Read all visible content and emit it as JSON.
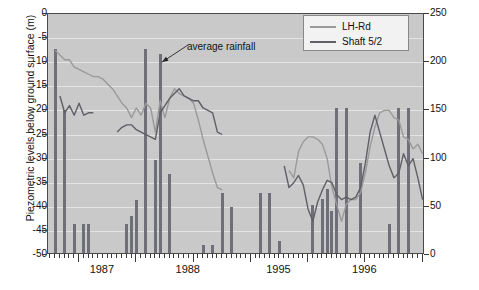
{
  "chart_data": {
    "type": "bar",
    "title": "",
    "xlabel": "",
    "ylabel": "Piezometric levels below ground surface (m)",
    "y2label": "Monthly rainfall (mm)",
    "ylim": [
      -50,
      0
    ],
    "y2lim": [
      0,
      250
    ],
    "yticks": [
      0,
      -5,
      -10,
      -15,
      -20,
      -25,
      -30,
      -35,
      -40,
      -45,
      -50
    ],
    "y2ticks": [
      0,
      50,
      100,
      150,
      200,
      250
    ],
    "x_year_labels": [
      "1987",
      "1988",
      "1995",
      "1996"
    ],
    "grid": true,
    "legend_position": "top-right",
    "annotations": [
      {
        "text": "average rainfall",
        "points_to_bar_index": 23
      }
    ],
    "bars": {
      "name": "Monthly rainfall",
      "color": "#6f6f79",
      "unit": "mm",
      "values": [
        {
          "i": 0,
          "mm": 0
        },
        {
          "i": 1,
          "mm": 212
        },
        {
          "i": 2,
          "mm": 0
        },
        {
          "i": 3,
          "mm": 148
        },
        {
          "i": 4,
          "mm": 0
        },
        {
          "i": 5,
          "mm": 30
        },
        {
          "i": 6,
          "mm": 0
        },
        {
          "i": 7,
          "mm": 30
        },
        {
          "i": 8,
          "mm": 30
        },
        {
          "i": 9,
          "mm": 0
        },
        {
          "i": 10,
          "mm": 0
        },
        {
          "i": 11,
          "mm": 0
        },
        {
          "i": 12,
          "mm": 0
        },
        {
          "i": 13,
          "mm": 0
        },
        {
          "i": 14,
          "mm": 0
        },
        {
          "i": 15,
          "mm": 0
        },
        {
          "i": 16,
          "mm": 30
        },
        {
          "i": 17,
          "mm": 38
        },
        {
          "i": 18,
          "mm": 55
        },
        {
          "i": 19,
          "mm": 0
        },
        {
          "i": 20,
          "mm": 212
        },
        {
          "i": 21,
          "mm": 0
        },
        {
          "i": 22,
          "mm": 97
        },
        {
          "i": 23,
          "mm": 206
        },
        {
          "i": 24,
          "mm": 0
        },
        {
          "i": 25,
          "mm": 82
        },
        {
          "i": 26,
          "mm": 0
        },
        {
          "i": 27,
          "mm": 0
        },
        {
          "i": 28,
          "mm": 0
        },
        {
          "i": 29,
          "mm": 0
        },
        {
          "i": 30,
          "mm": 0
        },
        {
          "i": 31,
          "mm": 0
        },
        {
          "i": 32,
          "mm": 8
        },
        {
          "i": 33,
          "mm": 0
        },
        {
          "i": 34,
          "mm": 8
        },
        {
          "i": 35,
          "mm": 0
        },
        {
          "i": 36,
          "mm": 62
        },
        {
          "i": 37,
          "mm": 0
        },
        {
          "i": 38,
          "mm": 48
        },
        {
          "i": 39,
          "mm": 0
        },
        {
          "i": 40,
          "mm": 0
        },
        {
          "i": 41,
          "mm": 0
        },
        {
          "i": 42,
          "mm": 0
        },
        {
          "i": 43,
          "mm": 0
        },
        {
          "i": 44,
          "mm": 62
        },
        {
          "i": 45,
          "mm": 0
        },
        {
          "i": 46,
          "mm": 62
        },
        {
          "i": 47,
          "mm": 0
        },
        {
          "i": 48,
          "mm": 12
        },
        {
          "i": 49,
          "mm": 0
        },
        {
          "i": 50,
          "mm": 0
        },
        {
          "i": 51,
          "mm": 0
        },
        {
          "i": 52,
          "mm": 0
        },
        {
          "i": 53,
          "mm": 0
        },
        {
          "i": 54,
          "mm": 0
        },
        {
          "i": 55,
          "mm": 50
        },
        {
          "i": 56,
          "mm": 0
        },
        {
          "i": 57,
          "mm": 56
        },
        {
          "i": 58,
          "mm": 66
        },
        {
          "i": 59,
          "mm": 44
        },
        {
          "i": 60,
          "mm": 150
        },
        {
          "i": 61,
          "mm": 0
        },
        {
          "i": 62,
          "mm": 150
        },
        {
          "i": 63,
          "mm": 0
        },
        {
          "i": 64,
          "mm": 0
        },
        {
          "i": 65,
          "mm": 93
        },
        {
          "i": 66,
          "mm": 0
        },
        {
          "i": 67,
          "mm": 0
        },
        {
          "i": 68,
          "mm": 0
        },
        {
          "i": 69,
          "mm": 0
        },
        {
          "i": 70,
          "mm": 0
        },
        {
          "i": 71,
          "mm": 30
        },
        {
          "i": 72,
          "mm": 0
        },
        {
          "i": 73,
          "mm": 150
        },
        {
          "i": 74,
          "mm": 0
        },
        {
          "i": 75,
          "mm": 150
        }
      ]
    },
    "series": [
      {
        "name": "LH-Rd",
        "color": "#9a9a9a",
        "unit": "m",
        "points": [
          {
            "i": 1,
            "m": -7.5
          },
          {
            "i": 2,
            "m": -8.5
          },
          {
            "i": 3,
            "m": -9.5
          },
          {
            "i": 4,
            "m": -9.5
          },
          {
            "i": 5,
            "m": -11.0
          },
          {
            "i": 6,
            "m": -11.5
          },
          {
            "i": 7,
            "m": -12.0
          },
          {
            "i": 8,
            "m": -12.5
          },
          {
            "i": 9,
            "m": -13.0
          },
          {
            "i": 10,
            "m": -13.0
          },
          {
            "i": 11,
            "m": -13.5
          },
          {
            "i": 12,
            "m": -14.5
          },
          {
            "i": 13,
            "m": -15.5
          },
          {
            "i": 14,
            "m": -17.0
          },
          {
            "i": 15,
            "m": -18.5
          },
          {
            "i": 16,
            "m": -19.5
          },
          {
            "i": 17,
            "m": -21.5
          },
          {
            "i": 18,
            "m": -19.5
          },
          {
            "i": 19,
            "m": -21.0
          },
          {
            "i": 20,
            "m": -18.5
          },
          {
            "i": 21,
            "m": -19.5
          },
          {
            "i": 22,
            "m": -24.5
          },
          {
            "i": 23,
            "m": -18.0
          },
          {
            "i": 24,
            "m": -21.5
          },
          {
            "i": 25,
            "m": -17.5
          },
          {
            "i": 26,
            "m": -15.5
          },
          {
            "i": 27,
            "m": -16.5
          },
          {
            "i": 28,
            "m": -17.0
          },
          {
            "i": 29,
            "m": -17.5
          },
          {
            "i": 30,
            "m": -18.5
          },
          {
            "i": 31,
            "m": -22.0
          },
          {
            "i": 32,
            "m": -26.0
          },
          {
            "i": 33,
            "m": -29.5
          },
          {
            "i": 34,
            "m": -33.0
          },
          {
            "i": 35,
            "m": -36.0
          },
          {
            "i": 36,
            "m": -36.5
          },
          {
            "i": 50,
            "m": -32.5
          },
          {
            "i": 51,
            "m": -34.0
          },
          {
            "i": 52,
            "m": -28.5
          },
          {
            "i": 53,
            "m": -26.5
          },
          {
            "i": 54,
            "m": -25.5
          },
          {
            "i": 55,
            "m": -25.5
          },
          {
            "i": 56,
            "m": -26.0
          },
          {
            "i": 57,
            "m": -27.0
          },
          {
            "i": 58,
            "m": -30.0
          },
          {
            "i": 59,
            "m": -36.0
          },
          {
            "i": 60,
            "m": -39.5
          },
          {
            "i": 61,
            "m": -43.0
          },
          {
            "i": 62,
            "m": -39.5
          },
          {
            "i": 63,
            "m": -38.5
          },
          {
            "i": 64,
            "m": -38.5
          },
          {
            "i": 65,
            "m": -37.0
          },
          {
            "i": 66,
            "m": -33.0
          },
          {
            "i": 67,
            "m": -27.5
          },
          {
            "i": 68,
            "m": -23.5
          },
          {
            "i": 69,
            "m": -20.5
          },
          {
            "i": 70,
            "m": -20.0
          },
          {
            "i": 71,
            "m": -20.0
          },
          {
            "i": 72,
            "m": -21.5
          },
          {
            "i": 73,
            "m": -22.0
          },
          {
            "i": 74,
            "m": -25.5
          },
          {
            "i": 75,
            "m": -26.0
          },
          {
            "i": 76,
            "m": -28.0
          },
          {
            "i": 77,
            "m": -27.0
          },
          {
            "i": 78,
            "m": -29.0
          }
        ]
      },
      {
        "name": "Shaft 5/2",
        "color": "#5f5f66",
        "unit": "m",
        "points": [
          {
            "i": 2,
            "m": -17.0
          },
          {
            "i": 3,
            "m": -20.5
          },
          {
            "i": 4,
            "m": -19.0
          },
          {
            "i": 5,
            "m": -21.0
          },
          {
            "i": 6,
            "m": -18.5
          },
          {
            "i": 7,
            "m": -21.0
          },
          {
            "i": 8,
            "m": -20.5
          },
          {
            "i": 9,
            "m": -20.5
          },
          {
            "i": 14,
            "m": -24.5
          },
          {
            "i": 15,
            "m": -23.5
          },
          {
            "i": 16,
            "m": -23.0
          },
          {
            "i": 17,
            "m": -23.0
          },
          {
            "i": 18,
            "m": -24.0
          },
          {
            "i": 19,
            "m": -24.5
          },
          {
            "i": 22,
            "m": -26.0
          },
          {
            "i": 23,
            "m": -20.5
          },
          {
            "i": 24,
            "m": -19.0
          },
          {
            "i": 25,
            "m": -17.5
          },
          {
            "i": 26,
            "m": -16.5
          },
          {
            "i": 27,
            "m": -15.5
          },
          {
            "i": 28,
            "m": -17.0
          },
          {
            "i": 29,
            "m": -17.5
          },
          {
            "i": 30,
            "m": -18.0
          },
          {
            "i": 31,
            "m": -18.0
          },
          {
            "i": 32,
            "m": -19.5
          },
          {
            "i": 33,
            "m": -20.0
          },
          {
            "i": 34,
            "m": -20.5
          },
          {
            "i": 35,
            "m": -24.5
          },
          {
            "i": 36,
            "m": -25.0
          },
          {
            "i": 49,
            "m": -31.5
          },
          {
            "i": 50,
            "m": -36.0
          },
          {
            "i": 51,
            "m": -35.0
          },
          {
            "i": 52,
            "m": -33.5
          },
          {
            "i": 53,
            "m": -35.5
          },
          {
            "i": 54,
            "m": -40.5
          },
          {
            "i": 55,
            "m": -43.0
          },
          {
            "i": 56,
            "m": -39.0
          },
          {
            "i": 57,
            "m": -36.5
          },
          {
            "i": 58,
            "m": -34.5
          },
          {
            "i": 59,
            "m": -35.0
          },
          {
            "i": 60,
            "m": -37.5
          },
          {
            "i": 61,
            "m": -38.5
          },
          {
            "i": 62,
            "m": -38.0
          },
          {
            "i": 63,
            "m": -38.5
          },
          {
            "i": 64,
            "m": -38.0
          },
          {
            "i": 65,
            "m": -36.0
          },
          {
            "i": 66,
            "m": -31.0
          },
          {
            "i": 67,
            "m": -24.5
          },
          {
            "i": 68,
            "m": -21.0
          },
          {
            "i": 69,
            "m": -24.5
          },
          {
            "i": 70,
            "m": -28.0
          },
          {
            "i": 71,
            "m": -31.5
          },
          {
            "i": 72,
            "m": -34.0
          },
          {
            "i": 73,
            "m": -33.0
          },
          {
            "i": 74,
            "m": -29.0
          },
          {
            "i": 75,
            "m": -31.5
          },
          {
            "i": 76,
            "m": -30.0
          },
          {
            "i": 77,
            "m": -34.0
          },
          {
            "i": 78,
            "m": -38.5
          }
        ]
      }
    ]
  },
  "legend": {
    "items": [
      {
        "label": "LH-Rd",
        "color": "#9a9a9a"
      },
      {
        "label": "Shaft 5/2",
        "color": "#5f5f66"
      }
    ]
  },
  "annotation": {
    "text": "average rainfall"
  },
  "axes": {
    "left_title": "Piezometric levels below ground surface (m)",
    "right_title": "Monthly rainfall (mm)"
  }
}
